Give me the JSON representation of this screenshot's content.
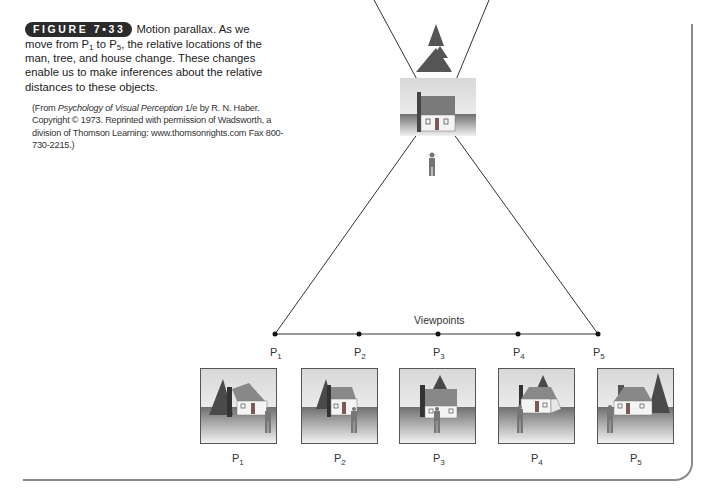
{
  "figure": {
    "badge": "FIGURE 7•33",
    "title": "Motion parallax.",
    "caption_part1": " As we move from P",
    "caption_sub1": "1",
    "caption_part2": " to P",
    "caption_sub2": "5",
    "caption_part3": ", the relative locations of the man, tree, and house change. These changes enable us to make inferences about the relative distances to these objects.",
    "credit_prefix": "(From ",
    "credit_title": "Psychology of Visual Perception",
    "credit_rest": " 1/e by R. N. Haber. Copyright © 1973. Reprinted with permission of Wadsworth, a division of Thomson Learning: www.thomsonrights.com Fax 800-730-2215.)"
  },
  "diagram": {
    "line_label": "Viewpoints",
    "viewpoints": [
      {
        "label": "P",
        "sub": "1"
      },
      {
        "label": "P",
        "sub": "2"
      },
      {
        "label": "P",
        "sub": "3"
      },
      {
        "label": "P",
        "sub": "4"
      },
      {
        "label": "P",
        "sub": "5"
      }
    ],
    "scene_objects": [
      "tree",
      "house",
      "man"
    ]
  },
  "thumbnails": [
    {
      "label": "P",
      "sub": "1"
    },
    {
      "label": "P",
      "sub": "2"
    },
    {
      "label": "P",
      "sub": "3"
    },
    {
      "label": "P",
      "sub": "4"
    },
    {
      "label": "P",
      "sub": "5"
    }
  ],
  "colors": {
    "badge_bg": "#2b2b2b",
    "frame": "#8a8a8a",
    "line": "#333333"
  }
}
